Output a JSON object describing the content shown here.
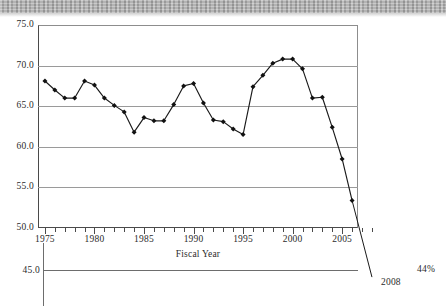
{
  "figure": {
    "background_banner": "scanned-gray-strip",
    "line_color": "#1a1a1a",
    "grid_color": "#9a9a9a",
    "axis_color": "#4a4a4a"
  },
  "axes": {
    "y_tick_labels": [
      "75.0",
      "70.0",
      "65.0",
      "60.0",
      "55.0",
      "50.0"
    ],
    "y_extra_label": "45.0",
    "x_tick_labels": [
      "1975",
      "1980",
      "1985",
      "1990",
      "1995",
      "2000",
      "2005"
    ],
    "x_axis_title": "Fiscal Year"
  },
  "annotations": {
    "projection_year": "2008",
    "projection_value": "44%"
  },
  "chart_data": {
    "type": "line",
    "title": "",
    "xlabel": "Fiscal Year",
    "ylabel": "",
    "xlim": [
      1974.3,
      2006.6
    ],
    "ylim": [
      50.0,
      75.0
    ],
    "yticks": [
      50.0,
      55.0,
      60.0,
      65.0,
      70.0,
      75.0
    ],
    "xticks": [
      1975,
      1980,
      1985,
      1990,
      1995,
      2000,
      2005
    ],
    "grid": "horizontal",
    "legend": "none",
    "markers": "filled-diamond",
    "x": [
      1975,
      1976,
      1977,
      1978,
      1979,
      1980,
      1981,
      1982,
      1983,
      1984,
      1985,
      1986,
      1987,
      1988,
      1989,
      1990,
      1991,
      1992,
      1993,
      1994,
      1995,
      1996,
      1997,
      1998,
      1999,
      2000,
      2001,
      2002,
      2003,
      2004,
      2005,
      2006
    ],
    "values": [
      68.1,
      67.0,
      66.0,
      66.0,
      68.1,
      67.6,
      66.0,
      65.1,
      64.3,
      61.8,
      63.6,
      63.2,
      63.2,
      65.2,
      67.5,
      67.8,
      65.4,
      63.3,
      63.1,
      62.2,
      61.5,
      67.4,
      68.8,
      70.3,
      70.8,
      70.8,
      69.6,
      66.0,
      66.1,
      62.4,
      58.5,
      53.4
    ],
    "projection": {
      "x": [
        2006,
        2008
      ],
      "values": [
        53.4,
        44.0
      ],
      "label": "2008",
      "value_label": "44%",
      "style": "extended-line-no-marker"
    }
  }
}
